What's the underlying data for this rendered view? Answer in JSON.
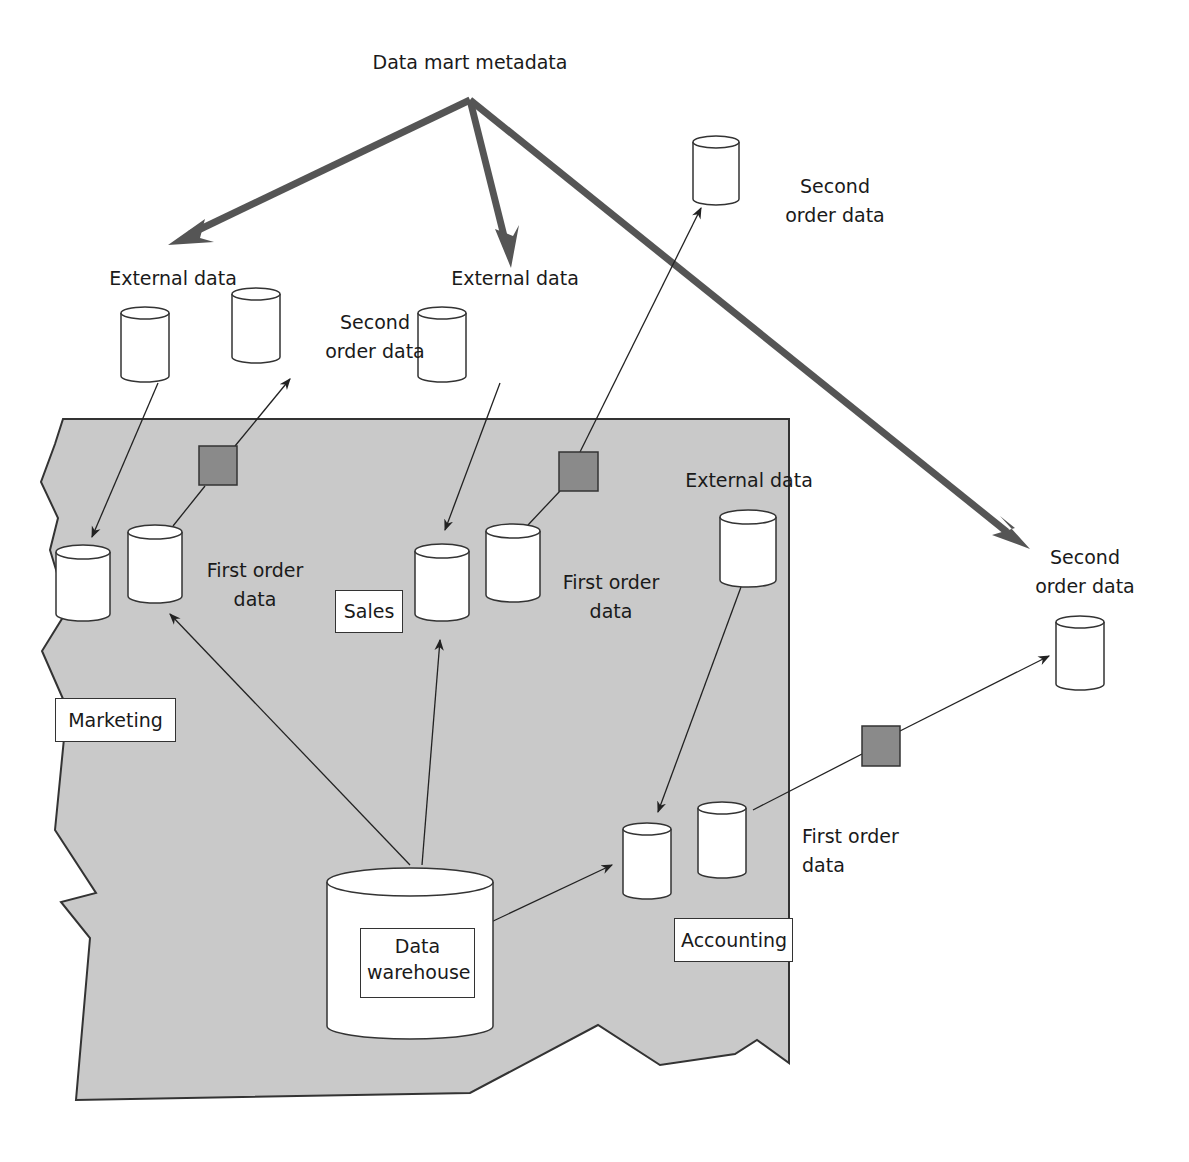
{
  "title": "Data mart metadata",
  "colors": {
    "region_fill": "#c9c9c9",
    "region_stroke": "#333333",
    "metadata_arrow": "#555555",
    "process_box": "#8a8a8a",
    "cylinder_fill": "#ffffff",
    "line": "#222222"
  },
  "labels": {
    "metadata": "Data mart metadata",
    "external_data_marketing": "External data",
    "second_order_marketing_1": "Second",
    "second_order_marketing_2": "order data",
    "external_data_sales": "External data",
    "second_order_sales_1": "Second",
    "second_order_sales_2": "order data",
    "external_data_accounting": "External data",
    "second_order_accounting_1": "Second",
    "second_order_accounting_2": "order data",
    "first_order_marketing_1": "First order",
    "first_order_marketing_2": "data",
    "first_order_sales_1": "First order",
    "first_order_sales_2": "data",
    "first_order_accounting_1": "First order",
    "first_order_accounting_2": "data"
  },
  "departments": {
    "marketing": "Marketing",
    "sales": "Sales",
    "accounting": "Accounting"
  },
  "warehouse": {
    "line1": "Data",
    "line2": "warehouse"
  }
}
